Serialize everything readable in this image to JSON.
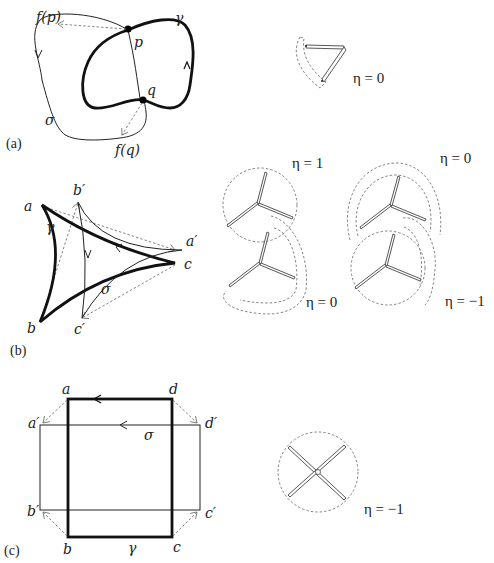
{
  "figure": {
    "panels": [
      {
        "id": "a",
        "label": "(a)",
        "curve_labels": {
          "gamma": "γ",
          "sigma": "σ"
        },
        "point_labels": {
          "p": "p",
          "q": "q",
          "fp": "f(p)",
          "fq": "f(q)"
        },
        "insets": [
          {
            "eta_label": "η = 0"
          }
        ]
      },
      {
        "id": "b",
        "label": "(b)",
        "curve_labels": {
          "gamma": "γ",
          "sigma": "σ"
        },
        "point_labels": {
          "a": "a",
          "b_prime": "b′",
          "a_prime": "a′",
          "c": "c",
          "b": "b",
          "c_prime": "c′"
        },
        "insets": [
          {
            "eta_label": "η = 1"
          },
          {
            "eta_label": "η = 0"
          },
          {
            "eta_label": "η = 0"
          },
          {
            "eta_label": "η = −1"
          }
        ]
      },
      {
        "id": "c",
        "label": "(c)",
        "curve_labels": {
          "gamma": "γ",
          "sigma": "σ"
        },
        "point_labels": {
          "a": "a",
          "d": "d",
          "a_prime": "a′",
          "d_prime": "d′",
          "b_prime": "b′",
          "c_prime": "c′",
          "b": "b",
          "c": "c"
        },
        "insets": [
          {
            "eta_label": "η = −1"
          }
        ]
      }
    ]
  }
}
